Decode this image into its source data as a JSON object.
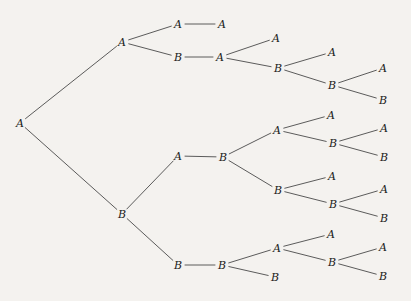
{
  "figure": {
    "type": "binary-branching-tree",
    "orientation": "left-to-right",
    "background_color": "#f4f2ef",
    "edge_color": "#4a4a4a",
    "label_color": "#1a1a1a",
    "label_font_style": "italic-serif",
    "label_alphabet": [
      "A",
      "B"
    ],
    "node_count": 31,
    "edge_count": 30,
    "depth": 6,
    "width": 411,
    "height": 301
  },
  "nodes": [
    {
      "id": "root",
      "label": "A",
      "x": 20,
      "y": 123,
      "depth": 0,
      "terminal": false
    },
    {
      "id": "A",
      "label": "A",
      "x": 122,
      "y": 42,
      "depth": 1,
      "terminal": false
    },
    {
      "id": "B",
      "label": "B",
      "x": 122,
      "y": 214,
      "depth": 1,
      "terminal": false
    },
    {
      "id": "A-A",
      "label": "A",
      "x": 178,
      "y": 24,
      "depth": 2,
      "terminal": false
    },
    {
      "id": "A-A-A",
      "label": "A",
      "x": 222,
      "y": 24,
      "depth": 3,
      "terminal": true
    },
    {
      "id": "A-B",
      "label": "B",
      "x": 178,
      "y": 57,
      "depth": 2,
      "terminal": false
    },
    {
      "id": "A-B-A",
      "label": "A",
      "x": 220,
      "y": 57,
      "depth": 3,
      "terminal": false
    },
    {
      "id": "A-B-A-A",
      "label": "A",
      "x": 276,
      "y": 38,
      "depth": 4,
      "terminal": true
    },
    {
      "id": "A-B-A-B",
      "label": "B",
      "x": 278,
      "y": 68,
      "depth": 4,
      "terminal": false
    },
    {
      "id": "A-B-A-B-A",
      "label": "A",
      "x": 332,
      "y": 52,
      "depth": 5,
      "terminal": true
    },
    {
      "id": "A-B-A-B-B",
      "label": "B",
      "x": 332,
      "y": 85,
      "depth": 5,
      "terminal": false
    },
    {
      "id": "A-B-A-B-B-A",
      "label": "A",
      "x": 383,
      "y": 68,
      "depth": 6,
      "terminal": true
    },
    {
      "id": "A-B-A-B-B-B",
      "label": "B",
      "x": 383,
      "y": 100,
      "depth": 6,
      "terminal": true
    },
    {
      "id": "B-A",
      "label": "A",
      "x": 178,
      "y": 156,
      "depth": 2,
      "terminal": false
    },
    {
      "id": "B-A-B",
      "label": "B",
      "x": 223,
      "y": 157,
      "depth": 3,
      "terminal": false
    },
    {
      "id": "B-A-B-A",
      "label": "A",
      "x": 277,
      "y": 130,
      "depth": 4,
      "terminal": false
    },
    {
      "id": "B-A-B-A-A",
      "label": "A",
      "x": 331,
      "y": 115,
      "depth": 5,
      "terminal": true
    },
    {
      "id": "B-A-B-A-B",
      "label": "B",
      "x": 333,
      "y": 143,
      "depth": 5,
      "terminal": false
    },
    {
      "id": "B-A-B-A-B-A",
      "label": "A",
      "x": 384,
      "y": 128,
      "depth": 6,
      "terminal": true
    },
    {
      "id": "B-A-B-A-B-B",
      "label": "B",
      "x": 384,
      "y": 157,
      "depth": 6,
      "terminal": true
    },
    {
      "id": "B-A-B-B",
      "label": "B",
      "x": 278,
      "y": 190,
      "depth": 4,
      "terminal": false
    },
    {
      "id": "B-A-B-B-A",
      "label": "A",
      "x": 332,
      "y": 176,
      "depth": 5,
      "terminal": true
    },
    {
      "id": "B-A-B-B-B",
      "label": "B",
      "x": 333,
      "y": 204,
      "depth": 5,
      "terminal": false
    },
    {
      "id": "B-A-B-B-B-A",
      "label": "A",
      "x": 384,
      "y": 189,
      "depth": 6,
      "terminal": true
    },
    {
      "id": "B-A-B-B-B-B",
      "label": "B",
      "x": 384,
      "y": 218,
      "depth": 6,
      "terminal": true
    },
    {
      "id": "B-B",
      "label": "B",
      "x": 178,
      "y": 265,
      "depth": 2,
      "terminal": false
    },
    {
      "id": "B-B-B",
      "label": "B",
      "x": 222,
      "y": 265,
      "depth": 3,
      "terminal": false
    },
    {
      "id": "B-B-B-A",
      "label": "A",
      "x": 277,
      "y": 248,
      "depth": 4,
      "terminal": false
    },
    {
      "id": "B-B-B-A-A",
      "label": "A",
      "x": 331,
      "y": 234,
      "depth": 5,
      "terminal": true
    },
    {
      "id": "B-B-B-A-B",
      "label": "B",
      "x": 332,
      "y": 262,
      "depth": 5,
      "terminal": false
    },
    {
      "id": "B-B-B-A-B-A",
      "label": "A",
      "x": 383,
      "y": 247,
      "depth": 6,
      "terminal": true
    },
    {
      "id": "B-B-B-A-B-B",
      "label": "B",
      "x": 383,
      "y": 276,
      "depth": 6,
      "terminal": true
    },
    {
      "id": "B-B-B-B",
      "label": "B",
      "x": 275,
      "y": 277,
      "depth": 4,
      "terminal": true
    }
  ],
  "edges": [
    {
      "from": "root",
      "to": "A"
    },
    {
      "from": "root",
      "to": "B"
    },
    {
      "from": "A",
      "to": "A-A"
    },
    {
      "from": "A-A",
      "to": "A-A-A"
    },
    {
      "from": "A",
      "to": "A-B"
    },
    {
      "from": "A-B",
      "to": "A-B-A"
    },
    {
      "from": "A-B-A",
      "to": "A-B-A-A"
    },
    {
      "from": "A-B-A",
      "to": "A-B-A-B"
    },
    {
      "from": "A-B-A-B",
      "to": "A-B-A-B-A"
    },
    {
      "from": "A-B-A-B",
      "to": "A-B-A-B-B"
    },
    {
      "from": "A-B-A-B-B",
      "to": "A-B-A-B-B-A"
    },
    {
      "from": "A-B-A-B-B",
      "to": "A-B-A-B-B-B"
    },
    {
      "from": "B",
      "to": "B-A"
    },
    {
      "from": "B-A",
      "to": "B-A-B"
    },
    {
      "from": "B-A-B",
      "to": "B-A-B-A"
    },
    {
      "from": "B-A-B-A",
      "to": "B-A-B-A-A"
    },
    {
      "from": "B-A-B-A",
      "to": "B-A-B-A-B"
    },
    {
      "from": "B-A-B-A-B",
      "to": "B-A-B-A-B-A"
    },
    {
      "from": "B-A-B-A-B",
      "to": "B-A-B-A-B-B"
    },
    {
      "from": "B-A-B",
      "to": "B-A-B-B"
    },
    {
      "from": "B-A-B-B",
      "to": "B-A-B-B-A"
    },
    {
      "from": "B-A-B-B",
      "to": "B-A-B-B-B"
    },
    {
      "from": "B-A-B-B-B",
      "to": "B-A-B-B-B-A"
    },
    {
      "from": "B-A-B-B-B",
      "to": "B-A-B-B-B-B"
    },
    {
      "from": "B",
      "to": "B-B"
    },
    {
      "from": "B-B",
      "to": "B-B-B"
    },
    {
      "from": "B-B-B",
      "to": "B-B-B-A"
    },
    {
      "from": "B-B-B-A",
      "to": "B-B-B-A-A"
    },
    {
      "from": "B-B-B-A",
      "to": "B-B-B-A-B"
    },
    {
      "from": "B-B-B-A-B",
      "to": "B-B-B-A-B-A"
    },
    {
      "from": "B-B-B-A-B",
      "to": "B-B-B-A-B-B"
    },
    {
      "from": "B-B-B",
      "to": "B-B-B-B"
    }
  ]
}
